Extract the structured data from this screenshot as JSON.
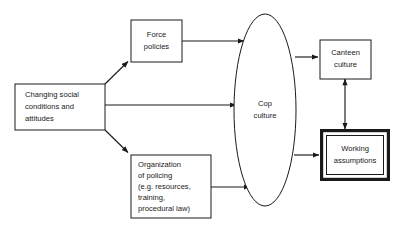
{
  "diagram": {
    "type": "flow-diagram",
    "background_color": "#ffffff",
    "line_color": "#1a1a1a",
    "nodes": {
      "changing_social": {
        "shape": "rectangle",
        "lines": [
          "Changing social",
          "conditions and",
          "attitudes"
        ]
      },
      "force_policies": {
        "shape": "rectangle",
        "lines": [
          "Force",
          "policies"
        ]
      },
      "organization_policing": {
        "shape": "rectangle",
        "lines": [
          "Organization",
          "of policing",
          "(e.g. resources,",
          "training,",
          "procedural law)"
        ]
      },
      "cop_culture": {
        "shape": "ellipse",
        "lines": [
          "Cop",
          "culture"
        ]
      },
      "canteen_culture": {
        "shape": "rectangle",
        "lines": [
          "Canteen",
          "culture"
        ]
      },
      "working_assumptions": {
        "shape": "double-rectangle",
        "lines": [
          "Working",
          "assumptions"
        ]
      }
    },
    "edges": [
      {
        "id": "social-to-force",
        "from": "changing_social",
        "to": "force_policies",
        "style": "diagonal-up",
        "arrowheads": 1
      },
      {
        "id": "social-to-cop",
        "from": "changing_social",
        "to": "cop_culture",
        "style": "horizontal",
        "arrowheads": 1
      },
      {
        "id": "social-to-org",
        "from": "changing_social",
        "to": "organization_policing",
        "style": "diagonal-down",
        "arrowheads": 1
      },
      {
        "id": "force-to-cop",
        "from": "force_policies",
        "to": "cop_culture",
        "style": "horizontal",
        "arrowheads": 1
      },
      {
        "id": "org-to-cop",
        "from": "organization_policing",
        "to": "cop_culture",
        "style": "horizontal",
        "arrowheads": 1
      },
      {
        "id": "cop-to-canteen",
        "from": "cop_culture",
        "to": "canteen_culture",
        "style": "horizontal",
        "arrowheads": 1
      },
      {
        "id": "cop-to-working",
        "from": "cop_culture",
        "to": "working_assumptions",
        "style": "horizontal",
        "arrowheads": 1
      },
      {
        "id": "canteen-working-bidirectional",
        "from": "canteen_culture",
        "to": "working_assumptions",
        "style": "vertical",
        "arrowheads": 2
      }
    ]
  }
}
